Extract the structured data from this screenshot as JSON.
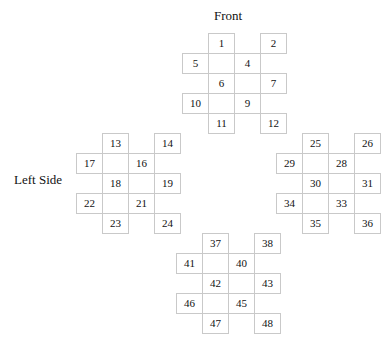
{
  "figure": {
    "type": "cube-surface-net-diagram",
    "labels": {
      "front": "Front",
      "left_side": "Left Side"
    },
    "cell_border_color": "#c9c9c9",
    "background_color": "#ffffff",
    "text_color": "#111111"
  },
  "clusters": [
    {
      "id": "front-cluster",
      "name": "Front",
      "rows": [
        {
          "offset": 1,
          "cells": [
            "1",
            "2"
          ]
        },
        {
          "offset": 0,
          "cells": [
            "3",
            "4",
            "5"
          ]
        },
        {
          "offset": 1,
          "cells": [
            "6",
            "7"
          ]
        },
        {
          "offset": 0,
          "cells": [
            "8",
            "9",
            "10"
          ]
        },
        {
          "offset": 1,
          "cells": [
            "11",
            "12"
          ]
        }
      ]
    },
    {
      "id": "left-cluster",
      "name": "Left Side",
      "rows": [
        {
          "offset": 1,
          "cells": [
            "13",
            "14"
          ]
        },
        {
          "offset": 0,
          "cells": [
            "15",
            "16",
            "17"
          ]
        },
        {
          "offset": 1,
          "cells": [
            "18",
            "19"
          ]
        },
        {
          "offset": 0,
          "cells": [
            "20",
            "21",
            "22"
          ]
        },
        {
          "offset": 1,
          "cells": [
            "23",
            "24"
          ]
        }
      ]
    },
    {
      "id": "right-cluster",
      "name": "Right Side",
      "rows": [
        {
          "offset": 1,
          "cells": [
            "25",
            "26"
          ]
        },
        {
          "offset": 0,
          "cells": [
            "27",
            "28",
            "29"
          ]
        },
        {
          "offset": 1,
          "cells": [
            "30",
            "31"
          ]
        },
        {
          "offset": 0,
          "cells": [
            "32",
            "33",
            "34"
          ]
        },
        {
          "offset": 1,
          "cells": [
            "35",
            "36"
          ]
        }
      ]
    },
    {
      "id": "bottom-cluster",
      "name": "Bottom",
      "rows": [
        {
          "offset": 1,
          "cells": [
            "37",
            "38"
          ]
        },
        {
          "offset": 0,
          "cells": [
            "39",
            "40",
            "41"
          ]
        },
        {
          "offset": 1,
          "cells": [
            "42",
            "43"
          ]
        },
        {
          "offset": 0,
          "cells": [
            "44",
            "45",
            "46"
          ]
        },
        {
          "offset": 1,
          "cells": [
            "47",
            "48"
          ]
        }
      ]
    }
  ]
}
